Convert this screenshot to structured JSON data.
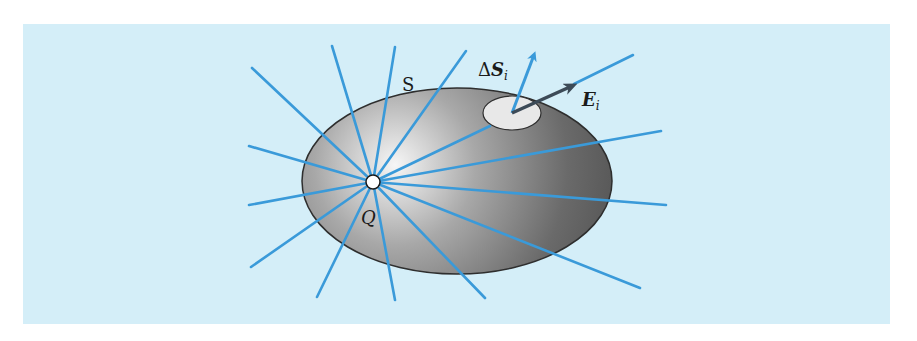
{
  "figure": {
    "type": "gauss-law-diagram",
    "colors": {
      "panel_background": "#d4eef8",
      "field_line": "#3a9ad9",
      "surface_light": "#f6f6f6",
      "surface_mid": "#9a9a9a",
      "surface_dark": "#555555",
      "surface_outline": "#2e2e2e",
      "patch_fill": "#e8e8e8",
      "e_vector": "#3c4a57",
      "charge_fill": "#ffffff"
    },
    "labels": {
      "surface": "S",
      "charge": "Q",
      "area_delta": "Δ",
      "area_symbol": "S",
      "area_subscript": "i",
      "field_symbol": "E",
      "field_subscript": "i"
    },
    "charge_position": {
      "x": 373,
      "y": 182
    },
    "surface_ellipse": {
      "cx": 457,
      "cy": 181,
      "rx": 155,
      "ry": 93
    },
    "patch_ellipse": {
      "cx": 512,
      "cy": 113,
      "rx": 29,
      "ry": 17
    },
    "field_line_endpoints": [
      [
        252,
        68
      ],
      [
        332,
        46
      ],
      [
        395,
        47
      ],
      [
        466,
        51
      ],
      [
        249,
        146
      ],
      [
        249,
        205
      ],
      [
        251,
        267
      ],
      [
        317,
        297
      ],
      [
        395,
        300
      ],
      [
        485,
        298
      ],
      [
        640,
        288
      ],
      [
        666,
        205
      ],
      [
        661,
        131
      ]
    ]
  }
}
